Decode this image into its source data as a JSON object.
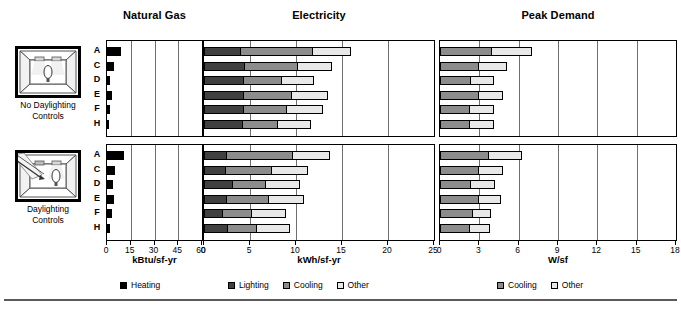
{
  "figure": {
    "width": 681,
    "height": 311,
    "bottom_rule": true
  },
  "groups": [
    {
      "id": "no-daylighting",
      "icon_name": "room-no-daylighting-icon",
      "caption_line1": "No Daylighting",
      "caption_line2": "Controls"
    },
    {
      "id": "daylighting",
      "icon_name": "room-daylighting-icon",
      "caption_line1": "Daylighting",
      "caption_line2": "Controls"
    }
  ],
  "row_labels": [
    "A",
    "C",
    "D",
    "E",
    "F",
    "H"
  ],
  "colors": {
    "heating": "#000000",
    "lighting": "#404040",
    "cooling": "#8c8c8c",
    "other": "#e8e8e8",
    "grid": "#6f6f6f",
    "axis": "#000000"
  },
  "legends": {
    "natural_gas": [
      {
        "label": "Heating",
        "color": "#000000"
      }
    ],
    "electricity": [
      {
        "label": "Lighting",
        "color": "#404040"
      },
      {
        "label": "Cooling",
        "color": "#8c8c8c"
      },
      {
        "label": "Other",
        "color": "#e8e8e8"
      }
    ],
    "peak_demand": [
      {
        "label": "Cooling",
        "color": "#8c8c8c"
      },
      {
        "label": "Other",
        "color": "#e8e8e8"
      }
    ]
  },
  "chart_data": [
    {
      "type": "bar",
      "id": "natural-gas",
      "title": "Natural Gas",
      "orientation": "horizontal",
      "stacked": true,
      "xlabel": "kBtu/sf-yr",
      "ylabel": "",
      "xlim": [
        0,
        60
      ],
      "xticks": [
        0,
        15,
        30,
        45,
        60
      ],
      "grid": true,
      "legend_position": "bottom",
      "categories": [
        "A",
        "C",
        "D",
        "E",
        "F",
        "H"
      ],
      "groups": [
        "No Daylighting Controls",
        "Daylighting Controls"
      ],
      "series": [
        {
          "name": "Heating",
          "color": "#000000",
          "values_no_daylighting": [
            9.0,
            4.5,
            2.0,
            3.2,
            1.8,
            1.0
          ],
          "values_daylighting": [
            11.0,
            5.0,
            4.0,
            4.2,
            3.0,
            1.8
          ]
        }
      ]
    },
    {
      "type": "bar",
      "id": "electricity",
      "title": "Electricity",
      "orientation": "horizontal",
      "stacked": true,
      "xlabel": "kWh/sf-yr",
      "ylabel": "",
      "xlim": [
        0,
        25
      ],
      "xticks": [
        0,
        5,
        10,
        15,
        20,
        25
      ],
      "grid": true,
      "legend_position": "bottom",
      "categories": [
        "A",
        "C",
        "D",
        "E",
        "F",
        "H"
      ],
      "groups": [
        "No Daylighting Controls",
        "Daylighting Controls"
      ],
      "series": [
        {
          "name": "Lighting",
          "color": "#404040",
          "values_no_daylighting": [
            4.0,
            4.5,
            4.3,
            4.3,
            4.3,
            4.2
          ],
          "values_daylighting": [
            2.5,
            2.4,
            3.2,
            2.5,
            2.1,
            2.6
          ]
        },
        {
          "name": "Cooling",
          "color": "#8c8c8c",
          "values_no_daylighting": [
            8.0,
            5.8,
            4.3,
            5.4,
            4.8,
            3.9
          ],
          "values_daylighting": [
            7.3,
            5.1,
            3.6,
            4.7,
            3.2,
            3.3
          ]
        },
        {
          "name": "Other",
          "color": "#e8e8e8",
          "values_no_daylighting": [
            4.2,
            3.8,
            3.6,
            4.0,
            4.0,
            3.8
          ],
          "values_daylighting": [
            4.1,
            4.0,
            3.9,
            3.9,
            3.8,
            3.7
          ]
        }
      ]
    },
    {
      "type": "bar",
      "id": "peak-demand",
      "title": "Peak Demand",
      "orientation": "horizontal",
      "stacked": true,
      "xlabel": "W/sf",
      "ylabel": "",
      "xlim": [
        0,
        18
      ],
      "xticks": [
        0,
        3,
        6,
        9,
        12,
        15,
        18
      ],
      "grid": true,
      "legend_position": "bottom",
      "categories": [
        "A",
        "C",
        "D",
        "E",
        "F",
        "H"
      ],
      "groups": [
        "No Daylighting Controls",
        "Daylighting Controls"
      ],
      "series": [
        {
          "name": "Cooling",
          "color": "#8c8c8c",
          "values_no_daylighting": [
            4.0,
            3.0,
            2.4,
            3.0,
            2.3,
            2.3
          ],
          "values_daylighting": [
            3.7,
            3.0,
            2.4,
            3.0,
            2.5,
            2.3
          ]
        },
        {
          "name": "Other",
          "color": "#e8e8e8",
          "values_no_daylighting": [
            3.1,
            2.2,
            1.8,
            1.9,
            1.9,
            1.9
          ],
          "values_daylighting": [
            2.6,
            1.9,
            1.9,
            1.7,
            1.5,
            1.6
          ]
        }
      ]
    }
  ]
}
